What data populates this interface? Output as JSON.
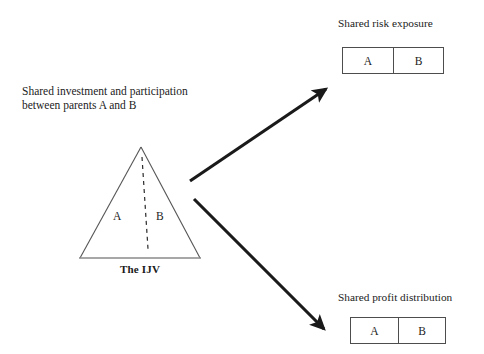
{
  "diagram": {
    "left_caption": "Shared investment and participation\nbetween parents A and B",
    "triangle": {
      "label_a": "A",
      "label_b": "B",
      "base_label": "The IJV",
      "divider_style": "dashed"
    },
    "outputs": [
      {
        "caption": "Shared risk exposure",
        "cells": [
          "A",
          "B"
        ]
      },
      {
        "caption": "Shared profit distribution",
        "cells": [
          "A",
          "B"
        ]
      }
    ],
    "arrows": [
      {
        "name": "arrow-to-risk",
        "direction": "up-right"
      },
      {
        "name": "arrow-to-profit",
        "direction": "down-right"
      }
    ],
    "colors": {
      "ink": "#1a1a1a",
      "text": "#222222",
      "outline": "#4d4d4d",
      "triangle_stroke": "#555555",
      "triangle_base": "#888888",
      "arrow": "#1a1a1a"
    }
  }
}
